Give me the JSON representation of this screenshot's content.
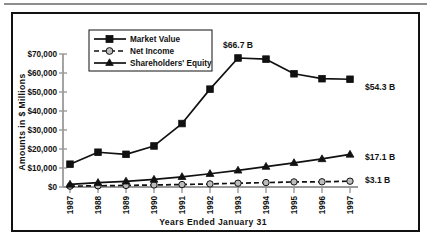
{
  "chart_data": {
    "type": "line",
    "title": "",
    "xlabel": "Years Ended January 31",
    "ylabel": "Amounts in $ Millions",
    "categories": [
      "1987",
      "1988",
      "1989",
      "1990",
      "1991",
      "1992",
      "1993",
      "1994",
      "1995",
      "1996",
      "1997"
    ],
    "ylim": [
      0,
      70000
    ],
    "ytick_labels": [
      "$70,000",
      "$60,000",
      "$50,000",
      "$40,000",
      "$30,000",
      "$20,000",
      "$10,000",
      "$0"
    ],
    "ytick_values": [
      70000,
      60000,
      50000,
      40000,
      30000,
      20000,
      10000,
      0
    ],
    "grid": false,
    "legend_position": "top-left-inside",
    "series": [
      {
        "name": "Market Value",
        "marker": "square",
        "linestyle": "solid",
        "values": [
          12000,
          18300,
          17200,
          21600,
          33400,
          51500,
          67900,
          67300,
          59600,
          57000,
          56700
        ]
      },
      {
        "name": "Net Income",
        "marker": "circle",
        "linestyle": "dashed",
        "values": [
          450,
          628,
          837,
          1076,
          1291,
          1609,
          1995,
          2333,
          2681,
          2740,
          3056
        ]
      },
      {
        "name": "Shareholders' Equity",
        "marker": "triangle",
        "linestyle": "solid",
        "values": [
          1340,
          2257,
          3008,
          3966,
          5366,
          6990,
          8759,
          10753,
          12726,
          14756,
          17143
        ]
      }
    ],
    "annotations": [
      {
        "id": "peak-market-value",
        "text": "$66.7 B",
        "series": "Market Value",
        "at_category": "1993"
      },
      {
        "id": "end-market-value",
        "text": "$54.3 B",
        "series": "Market Value",
        "at_category": "1997"
      },
      {
        "id": "end-shareholders-equity",
        "text": "$17.1 B",
        "series": "Shareholders' Equity",
        "at_category": "1997"
      },
      {
        "id": "end-net-income",
        "text": "$3.1 B",
        "series": "Net Income",
        "at_category": "1997"
      }
    ]
  },
  "legend": {
    "items": [
      {
        "label": "Market Value"
      },
      {
        "label": "Net Income"
      },
      {
        "label": "Shareholders' Equity"
      }
    ]
  },
  "axes": {
    "y_title": "Amounts in $ Millions",
    "x_title": "Years Ended January 31",
    "y_labels": {
      "t70": "$70,000",
      "t60": "$60,000",
      "t50": "$50,000",
      "t40": "$40,000",
      "t30": "$30,000",
      "t20": "$20,000",
      "t10": "$10,000",
      "t0": "$0"
    },
    "x_labels": {
      "y1987": "1987",
      "y1988": "1988",
      "y1989": "1989",
      "y1990": "1990",
      "y1991": "1991",
      "y1992": "1992",
      "y1993": "1993",
      "y1994": "1994",
      "y1995": "1995",
      "y1996": "1996",
      "y1997": "1997"
    }
  },
  "annotations": {
    "peak": "$66.7 B",
    "market_value_end": "$54.3 B",
    "shareholders_equity_end": "$17.1 B",
    "net_income_end": "$3.1 B"
  },
  "colors": {
    "ink": "#111111",
    "axis": "#9a9a9a",
    "frame": "#111111",
    "rule": "#8d8d8d",
    "background": "#ffffff"
  }
}
